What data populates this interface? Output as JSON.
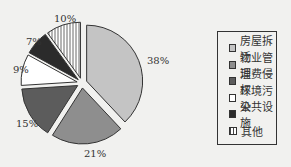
{
  "chart_data": {
    "type": "pie",
    "title": "",
    "categories": [
      "房屋拆迁",
      "物业管理",
      "消费侵权",
      "环境污染",
      "公共设施",
      "其他"
    ],
    "values": [
      38,
      21,
      15,
      9,
      7,
      10
    ],
    "labels": [
      "38%",
      "21%",
      "15%",
      "9%",
      "7%",
      "10%"
    ],
    "colors": [
      "#c4c4c4",
      "#8e8e8e",
      "#5c5c5c",
      "#ffffff",
      "#2b2b2b",
      "hatch"
    ],
    "legend_position": "right",
    "exploded": true
  },
  "legend": {
    "items": [
      {
        "label": "房屋拆迁",
        "color": "#c4c4c4"
      },
      {
        "label": "物业管理",
        "color": "#8e8e8e"
      },
      {
        "label": "消费侵权",
        "color": "#5c5c5c"
      },
      {
        "label": "环境污染",
        "color": "#ffffff"
      },
      {
        "label": "公共设施",
        "color": "#2b2b2b"
      },
      {
        "label": "其他",
        "color": "hatch"
      }
    ]
  }
}
